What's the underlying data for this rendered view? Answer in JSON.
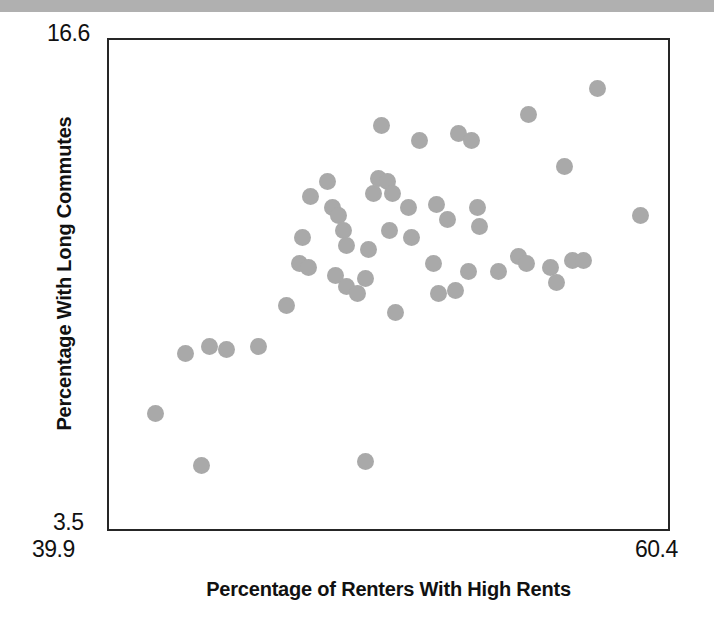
{
  "figure": {
    "background_color": "#ffffff",
    "top_band_color": "#b0b0b0",
    "frame_color": "#262626",
    "marker_color": "#a9a9a9"
  },
  "axes": {
    "x_title": "Percentage of Renters With High Rents",
    "y_title": "Percentage With Long Commutes",
    "x_tick_min": "39.9",
    "x_tick_max": "60.4",
    "y_tick_min": "3.5",
    "y_tick_max": "16.6"
  },
  "chart_data": {
    "type": "scatter",
    "title": "",
    "xlabel": "Percentage of Renters With High Rents",
    "ylabel": "Percentage With Long Commutes",
    "xlim": [
      39.9,
      60.4
    ],
    "ylim": [
      3.5,
      16.6
    ],
    "grid": false,
    "legend": null,
    "marker": {
      "shape": "circle",
      "color": "#a9a9a9",
      "size_px": 17
    },
    "n_points": 53,
    "points": [
      {
        "x": 41.6,
        "y": 6.6
      },
      {
        "x": 43.3,
        "y": 5.2
      },
      {
        "x": 42.7,
        "y": 8.2
      },
      {
        "x": 43.6,
        "y": 8.4
      },
      {
        "x": 44.2,
        "y": 8.3
      },
      {
        "x": 45.4,
        "y": 8.4
      },
      {
        "x": 46.4,
        "y": 9.5
      },
      {
        "x": 46.9,
        "y": 10.6
      },
      {
        "x": 47.2,
        "y": 10.5
      },
      {
        "x": 47.0,
        "y": 11.3
      },
      {
        "x": 47.3,
        "y": 12.4
      },
      {
        "x": 47.9,
        "y": 12.8
      },
      {
        "x": 48.1,
        "y": 12.1
      },
      {
        "x": 48.3,
        "y": 11.9
      },
      {
        "x": 48.5,
        "y": 11.5
      },
      {
        "x": 48.6,
        "y": 11.1
      },
      {
        "x": 48.2,
        "y": 10.3
      },
      {
        "x": 48.6,
        "y": 10.0
      },
      {
        "x": 49.0,
        "y": 9.8
      },
      {
        "x": 49.3,
        "y": 10.2
      },
      {
        "x": 49.4,
        "y": 11.0
      },
      {
        "x": 49.6,
        "y": 12.5
      },
      {
        "x": 49.8,
        "y": 12.9
      },
      {
        "x": 50.1,
        "y": 12.8
      },
      {
        "x": 50.3,
        "y": 12.5
      },
      {
        "x": 49.9,
        "y": 14.3
      },
      {
        "x": 50.2,
        "y": 11.5
      },
      {
        "x": 50.4,
        "y": 9.3
      },
      {
        "x": 49.3,
        "y": 5.3
      },
      {
        "x": 50.9,
        "y": 12.1
      },
      {
        "x": 51.0,
        "y": 11.3
      },
      {
        "x": 51.3,
        "y": 13.9
      },
      {
        "x": 51.8,
        "y": 10.6
      },
      {
        "x": 51.9,
        "y": 12.2
      },
      {
        "x": 52.3,
        "y": 11.8
      },
      {
        "x": 52.0,
        "y": 9.8
      },
      {
        "x": 52.7,
        "y": 14.1
      },
      {
        "x": 53.2,
        "y": 13.9
      },
      {
        "x": 53.4,
        "y": 12.1
      },
      {
        "x": 53.5,
        "y": 11.6
      },
      {
        "x": 53.1,
        "y": 10.4
      },
      {
        "x": 54.2,
        "y": 10.4
      },
      {
        "x": 54.9,
        "y": 10.8
      },
      {
        "x": 55.2,
        "y": 10.6
      },
      {
        "x": 55.3,
        "y": 14.6
      },
      {
        "x": 56.1,
        "y": 10.5
      },
      {
        "x": 56.3,
        "y": 10.1
      },
      {
        "x": 56.6,
        "y": 13.2
      },
      {
        "x": 56.9,
        "y": 10.7
      },
      {
        "x": 57.3,
        "y": 10.7
      },
      {
        "x": 57.8,
        "y": 15.3
      },
      {
        "x": 59.4,
        "y": 11.9
      },
      {
        "x": 52.6,
        "y": 9.9
      }
    ]
  }
}
